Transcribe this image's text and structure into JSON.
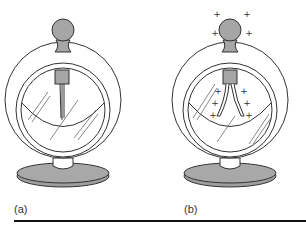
{
  "figure": {
    "panels": [
      {
        "id": "a",
        "label": "(a)",
        "state": "uncharged",
        "leaves": "closed",
        "charges": []
      },
      {
        "id": "b",
        "label": "(b)",
        "state": "charged",
        "leaves": "spread",
        "charges": [
          "+",
          "+",
          "+",
          "+",
          "+",
          "+",
          "+",
          "+",
          "+",
          "+"
        ]
      }
    ],
    "charge_symbol": "+",
    "colors": {
      "metal_fill": "#a6a6a6",
      "outline": "#333333",
      "base_fill": "#a0a0a0",
      "rule": "#111111"
    }
  }
}
